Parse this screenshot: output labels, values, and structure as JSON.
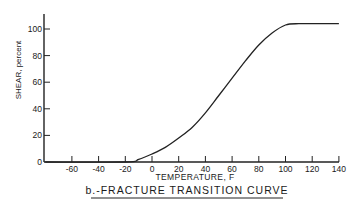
{
  "chart_data": {
    "type": "line",
    "title": "b.-FRACTURE TRANSITION CURVE",
    "xlabel": "TEMPERATURE, F",
    "ylabel": "SHEAR, percent",
    "x_ticks": [
      -60,
      -40,
      -20,
      0,
      20,
      40,
      60,
      80,
      100,
      120,
      140
    ],
    "y_ticks": [
      0,
      20,
      40,
      60,
      80,
      100
    ],
    "xlim": [
      -80,
      140
    ],
    "ylim": [
      0,
      110
    ],
    "grid": false,
    "legend": null,
    "series": [
      {
        "name": "Fracture transition curve",
        "x": [
          -80,
          -20,
          -10,
          0,
          10,
          20,
          30,
          40,
          50,
          60,
          70,
          80,
          90,
          100,
          110,
          120,
          140
        ],
        "y": [
          0,
          0,
          2,
          6,
          11,
          18,
          26,
          37,
          50,
          63,
          76,
          88,
          97,
          103,
          104,
          104,
          104
        ]
      }
    ]
  },
  "labels": {
    "title": "b.-FRACTURE TRANSITION CURVE",
    "xlabel": "TEMPERATURE, F",
    "ylabel": "SHEAR, percent"
  }
}
